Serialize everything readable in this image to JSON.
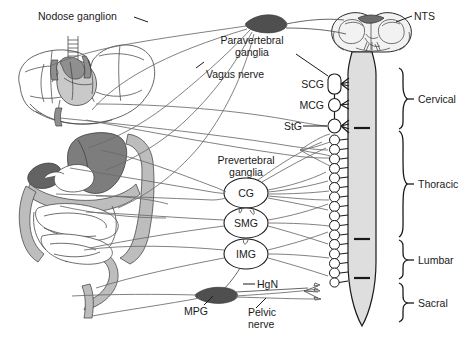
{
  "figure": {
    "width": 476,
    "height": 346,
    "background": "#ffffff"
  },
  "labels": {
    "nodose_ganglion": "Nodose ganglion",
    "vagus_nerve": "Vagus nerve",
    "paravertebral_ganglia_line1": "Paravertebral",
    "paravertebral_ganglia_line2": "ganglia",
    "nts": "NTS",
    "scg": "SCG",
    "mcg": "MCG",
    "stg": "StG",
    "prevertebral_ganglia_line1": "Prevertebral",
    "prevertebral_ganglia_line2": "ganglia",
    "cg": "CG",
    "smg": "SMG",
    "img": "IMG",
    "hgn": "HgN",
    "mpg": "MPG",
    "pelvic_nerve_line1": "Pelvic",
    "pelvic_nerve_line2": "nerve"
  },
  "spinal_levels": [
    {
      "id": "cervical",
      "label": "Cervical",
      "y_top": 68,
      "y_bottom": 129,
      "label_y": 99
    },
    {
      "id": "thoracic",
      "label": "Thoracic",
      "y_top": 131,
      "y_bottom": 237,
      "label_y": 184
    },
    {
      "id": "lumbar",
      "label": "Lumbar",
      "y_top": 240,
      "y_bottom": 279,
      "label_y": 260
    },
    {
      "id": "sacral",
      "label": "Sacral",
      "y_top": 283,
      "y_bottom": 322,
      "label_y": 303
    }
  ],
  "paravertebral_ganglia": [
    {
      "id": "scg",
      "label": "SCG",
      "shape": "rounded-rect",
      "cx": 335,
      "cy": 84
    },
    {
      "id": "mcg",
      "label": "MCG",
      "shape": "oval",
      "cx": 335,
      "cy": 105
    },
    {
      "id": "stg",
      "label": "StG",
      "shape": "oval",
      "cx": 335,
      "cy": 126
    }
  ],
  "prevertebral_ganglia": [
    {
      "id": "cg",
      "label": "CG",
      "cx": 246,
      "cy": 193
    },
    {
      "id": "smg",
      "label": "SMG",
      "cx": 246,
      "cy": 223
    },
    {
      "id": "img",
      "label": "IMG",
      "cx": 246,
      "cy": 254
    }
  ],
  "dark_ganglia": [
    {
      "id": "nodose-ganglion",
      "label": "Nodose ganglion",
      "cx": 264,
      "cy": 22
    },
    {
      "id": "mpg",
      "label": "MPG",
      "cx": 215,
      "cy": 294
    }
  ],
  "organs": [
    {
      "id": "lungs-heart",
      "label": "lungs and heart"
    },
    {
      "id": "stomach",
      "label": "stomach"
    },
    {
      "id": "small-intestine",
      "label": "small intestine"
    },
    {
      "id": "colon",
      "label": "colon"
    },
    {
      "id": "liver",
      "label": "liver"
    }
  ],
  "cns": [
    {
      "id": "brainstem",
      "label": "brainstem cross-section"
    },
    {
      "id": "spinal-cord",
      "label": "spinal cord"
    }
  ],
  "colors": {
    "line": "#4a4a4a",
    "nerve": "#6a6a6a",
    "text": "#1a1a1a",
    "cord_fill": "#dedede",
    "gi_light": "#bdbdbd",
    "gi_dark": "#7d7d7d",
    "ganglion_dark": "#4f4f4f",
    "background": "#ffffff"
  }
}
